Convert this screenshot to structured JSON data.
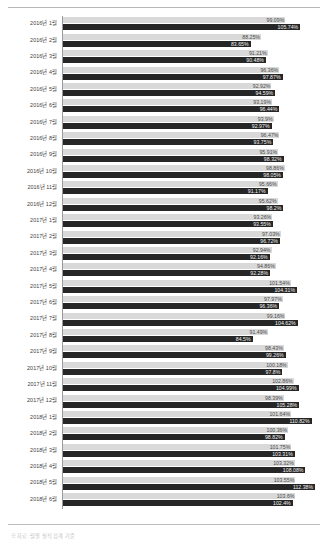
{
  "chart_data": {
    "type": "bar",
    "orientation": "horizontal",
    "title": "",
    "xlabel": "",
    "ylabel": "",
    "xlim": [
      0,
      115
    ],
    "grid": false,
    "legend_position": "bottom",
    "categories": [
      "2016년 1월",
      "2016년 2월",
      "2016년 3월",
      "2016년 4월",
      "2016년 5월",
      "2016년 6월",
      "2016년 7월",
      "2016년 8월",
      "2016년 9월",
      "2016년 10월",
      "2016년 11월",
      "2016년 12월",
      "2017년 1월",
      "2017년 2월",
      "2017년 3월",
      "2017년 4월",
      "2017년 5월",
      "2017년 6월",
      "2017년 7월",
      "2017년 8월",
      "2017년 9월",
      "2017년 10월",
      "2017년 11월",
      "2017년 12월",
      "2018년 1월",
      "2018년 2월",
      "2018년 3월",
      "2018년 4월",
      "2018년 5월",
      "2018년 6월"
    ],
    "series": [
      {
        "name": "계획",
        "color": "#d9d9d9",
        "values": [
          99.09,
          88.25,
          91.21,
          96.36,
          92.92,
          93.19,
          93.9,
          96.47,
          95.91,
          98.86,
          95.66,
          95.62,
          93.26,
          97.03,
          92.94,
          94.86,
          101.54,
          97.97,
          99.16,
          91.49,
          98.43,
          100.18,
          102.86,
          98.39,
          101.64,
          100.36,
          101.75,
          103.32,
          103.55,
          103.6
        ],
        "labels": [
          "99.09%",
          "88.25%",
          "91.21%",
          "96.36%",
          "92.92%",
          "93.19%",
          "93.9%",
          "96.47%",
          "95.91%",
          "98.86%",
          "95.66%",
          "95.62%",
          "93.26%",
          "97.03%",
          "92.94%",
          "94.86%",
          "101.54%",
          "97.97%",
          "99.16%",
          "91.49%",
          "98.43%",
          "100.18%",
          "102.86%",
          "98.39%",
          "101.64%",
          "100.36%",
          "101.75%",
          "103.32%",
          "103.55%",
          "103.6%"
        ]
      },
      {
        "name": "실적",
        "color": "#262626",
        "values": [
          105.74,
          83.65,
          90.48,
          97.87,
          94.59,
          96.44,
          92.97,
          93.75,
          98.32,
          98.05,
          91.17,
          98.2,
          93.55,
          96.72,
          92.16,
          92.28,
          104.31,
          96.36,
          104.62,
          84.5,
          99.26,
          97.8,
          104.99,
          105.28,
          110.82,
          98.82,
          103.31,
          108.08,
          112.38,
          102.4
        ],
        "labels": [
          "105.74%",
          "83.65%",
          "90.48%",
          "97.87%",
          "94.59%",
          "96.44%",
          "92.97%",
          "93.75%",
          "98.32%",
          "98.05%",
          "91.17%",
          "98.2%",
          "93.55%",
          "96.72%",
          "92.16%",
          "92.28%",
          "104.31%",
          "96.36%",
          "104.62%",
          "84.5%",
          "99.26%",
          "97.8%",
          "104.99%",
          "105.28%",
          "110.82%",
          "98.82%",
          "103.31%",
          "108.08%",
          "112.38%",
          "102.4%"
        ]
      }
    ]
  },
  "footer": {
    "legend_text": "※ 자료: 월별 실적 집계 기준"
  }
}
